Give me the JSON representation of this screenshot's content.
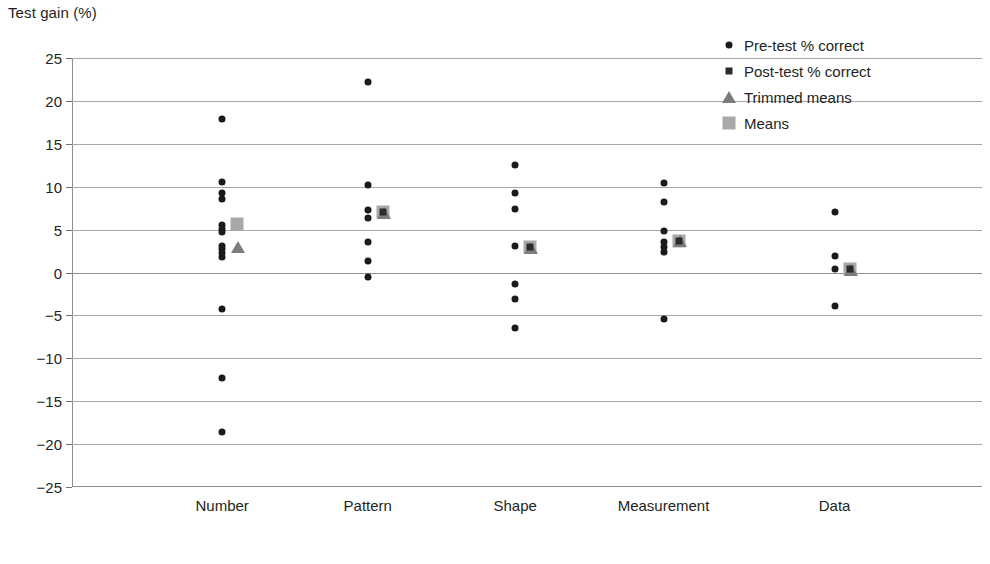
{
  "chart_data": {
    "type": "scatter",
    "title": "",
    "ylabel": "Test gain (%)",
    "xlabel": "",
    "ylim": [
      -25,
      25
    ],
    "ytick_step": 5,
    "grid": true,
    "legend_position": "top-right",
    "categories": [
      "Number",
      "Pattern",
      "Shape",
      "Measurement",
      "Data"
    ],
    "ytick_labels": [
      "25",
      "20",
      "15",
      "10",
      "5",
      "0",
      "−5",
      "−10",
      "−15",
      "−20",
      "−25"
    ],
    "ytick_values": [
      25,
      20,
      15,
      10,
      5,
      0,
      -5,
      -10,
      -15,
      -20,
      -25
    ],
    "legend": [
      {
        "label": "Pre-test % correct",
        "marker": "dot",
        "color": "#1a1a1a"
      },
      {
        "label": "Post-test % correct",
        "marker": "square",
        "color": "#2b2b2b"
      },
      {
        "label": "Trimmed means",
        "marker": "triangle",
        "color": "#7d7d7d"
      },
      {
        "label": "Means",
        "marker": "mean-square",
        "color": "#a8a8a8"
      }
    ],
    "series": [
      {
        "name": "Pre-test % correct",
        "marker": "dot",
        "points": {
          "Number": [
            17.9,
            10.6,
            9.3,
            8.6,
            5.5,
            5.1,
            4.7,
            3.1,
            2.7,
            2.3,
            1.8,
            -4.3,
            -12.3,
            -18.6
          ],
          "Pattern": [
            22.2,
            10.2,
            7.3,
            6.3,
            3.5,
            1.3,
            -0.5
          ],
          "Shape": [
            12.5,
            9.3,
            7.4,
            3.1,
            -1.3,
            -3.1,
            -6.5
          ],
          "Measurement": [
            10.4,
            8.2,
            4.8,
            3.6,
            3.0,
            2.4,
            -5.4
          ],
          "Data": [
            7.1,
            1.9,
            0.4,
            -3.9
          ]
        }
      },
      {
        "name": "Post-test % correct",
        "marker": "square",
        "points": {
          "Number": [],
          "Pattern": [
            7.1
          ],
          "Shape": [
            3.0
          ],
          "Measurement": [
            3.7
          ],
          "Data": [
            0.4
          ]
        }
      },
      {
        "name": "Trimmed means",
        "marker": "triangle",
        "points": {
          "Number": [
            3.1
          ],
          "Pattern": [
            7.0
          ],
          "Shape": [
            3.0
          ],
          "Measurement": [
            3.8
          ],
          "Data": [
            0.4
          ]
        }
      },
      {
        "name": "Means",
        "marker": "mean-square",
        "points": {
          "Number": [
            5.6
          ],
          "Pattern": [
            7.1
          ],
          "Shape": [
            3.0
          ],
          "Measurement": [
            3.7
          ],
          "Data": [
            0.4
          ]
        }
      }
    ]
  }
}
